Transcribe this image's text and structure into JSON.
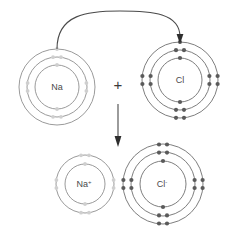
{
  "figure": {
    "background_color": "#ffffff",
    "width": 235,
    "height": 240
  },
  "colors": {
    "ring_stroke": "#6f6f6f",
    "ring_stroke_faint": "#8e8e8e",
    "electron_fill": "#5a5a5a",
    "electron_fill_faint": "#cfcfcf",
    "label_text": "#4a4a4a",
    "arrow": "#4a4a4a",
    "arrow_head": "#2e2e2e"
  },
  "operators": {
    "plus_symbol": "+"
  },
  "reactants": {
    "sodium": {
      "label": "Na",
      "charge": "",
      "element_name": "sodium",
      "center": {
        "x": 57,
        "y": 87
      },
      "shell_count": 3,
      "shells": [
        {
          "index": 1,
          "radius": 22,
          "electrons": 2,
          "faint": true
        },
        {
          "index": 2,
          "radius": 30,
          "electrons": 8,
          "faint": true
        },
        {
          "index": 3,
          "radius": 38,
          "electrons": 1,
          "faint": true
        }
      ]
    },
    "chlorine": {
      "label": "Cl",
      "charge": "",
      "element_name": "chlorine",
      "center": {
        "x": 180,
        "y": 80
      },
      "shell_count": 3,
      "shells": [
        {
          "index": 1,
          "radius": 22,
          "electrons": 2,
          "faint": false
        },
        {
          "index": 2,
          "radius": 30,
          "electrons": 8,
          "faint": false
        },
        {
          "index": 3,
          "radius": 38,
          "electrons": 7,
          "faint": false
        }
      ]
    }
  },
  "products": {
    "sodium_ion": {
      "label": "Na",
      "charge": "+",
      "element_name": "sodium ion",
      "center": {
        "x": 85,
        "y": 184
      },
      "shell_count": 2,
      "shells": [
        {
          "index": 1,
          "radius": 20,
          "electrons": 2,
          "faint": true
        },
        {
          "index": 2,
          "radius": 29,
          "electrons": 8,
          "faint": true
        }
      ]
    },
    "chloride_ion": {
      "label": "Cl",
      "charge": "-",
      "element_name": "chloride ion",
      "center": {
        "x": 163,
        "y": 184
      },
      "shell_count": 3,
      "shells": [
        {
          "index": 1,
          "radius": 23,
          "electrons": 2,
          "faint": false
        },
        {
          "index": 2,
          "radius": 32,
          "electrons": 8,
          "faint": false
        },
        {
          "index": 3,
          "radius": 40,
          "electrons": 8,
          "faint": false
        }
      ]
    }
  },
  "arrows": {
    "electron_transfer": {
      "description": "curved arrow from sodium outer shell to chlorine outer shell",
      "start": {
        "x": 57,
        "y": 49
      },
      "end": {
        "x": 180,
        "y": 42
      }
    },
    "reaction": {
      "description": "downward reaction arrow",
      "start": {
        "x": 118,
        "y": 104
      },
      "end": {
        "x": 118,
        "y": 146
      }
    }
  }
}
